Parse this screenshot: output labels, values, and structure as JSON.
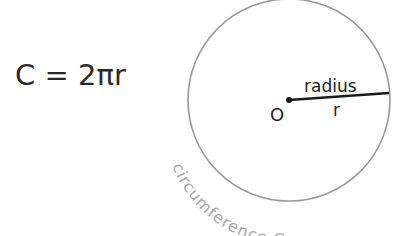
{
  "formula": {
    "text": "C = 2πr"
  },
  "diagram": {
    "center_label": "O",
    "radius_label": "radius",
    "radius_symbol": "r",
    "circumference_label": "circumference C",
    "colors": {
      "circle_stroke": "#9a9a9a",
      "radius_line": "#1a1a1a",
      "circumference_text": "#a9a9a9",
      "text": "#222222"
    }
  }
}
